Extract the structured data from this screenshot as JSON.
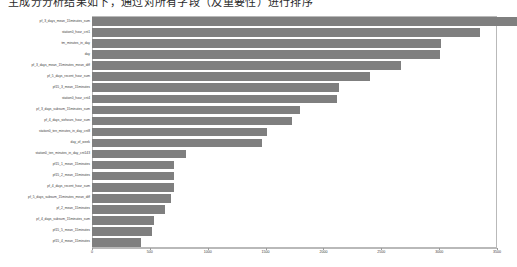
{
  "document": {
    "heading_line": "主成分分析结果如下，通过对所有字段（及重要性）进行排序"
  },
  "figure": {
    "name": "feature-importance-bar-chart",
    "background_color": "#ffffff",
    "bar_color": "#7f7f7f",
    "border_color": "#b9b9b9"
  },
  "chart_data": {
    "type": "bar",
    "orientation": "horizontal",
    "title": "",
    "xlabel": "",
    "ylabel": "",
    "xlim": [
      0,
      3500
    ],
    "ylim": null,
    "grid": false,
    "legend": null,
    "xticks": [
      0,
      500,
      1000,
      1500,
      2000,
      2500,
      3000,
      3500
    ],
    "xticklabels": [
      "0",
      "500",
      "1000",
      "1500",
      "2000",
      "2500",
      "3000",
      "3500"
    ],
    "categories": [
      "pf_3_days_mean_15minutes_sum",
      "station0_hour_cnt1",
      "tm_minutes_in_day",
      "day",
      "pf_3_days_mean_15minutes_mean_diff",
      "pf_5_days_recent_hour_sum",
      "pf15_3_mean_15minutes",
      "station0_hour_cnt4",
      "pf_3_days_subsum_15minutes_sum",
      "pf_4_days_sixhours_hour_sum",
      "station0_ten_minutes_in_day_cnt8",
      "day_of_week",
      "station0_ten_minutes_in_day_cnt143",
      "pf15_1_mean_15minutes",
      "pf15_2_mean_15minutes",
      "pf_4_days_recent_hour_sum",
      "pf_5_days_subsum_15minutes_mean_diff",
      "pf_2_mean_15minutes",
      "pf_4_days_subsum_15minutes_sum",
      "pf15_5_mean_15minutes",
      "pf15_4_mean_15minutes"
    ],
    "values": [
      3670,
      3350,
      3020,
      3010,
      2670,
      2400,
      2135,
      2115,
      1795,
      1730,
      1515,
      1465,
      815,
      710,
      710,
      710,
      680,
      630,
      535,
      515,
      420
    ],
    "series": [
      {
        "name": "feature importance",
        "values": [
          3670,
          3350,
          3020,
          3010,
          2670,
          2400,
          2135,
          2115,
          1795,
          1730,
          1515,
          1465,
          815,
          710,
          710,
          710,
          680,
          630,
          535,
          515,
          420
        ]
      }
    ]
  }
}
